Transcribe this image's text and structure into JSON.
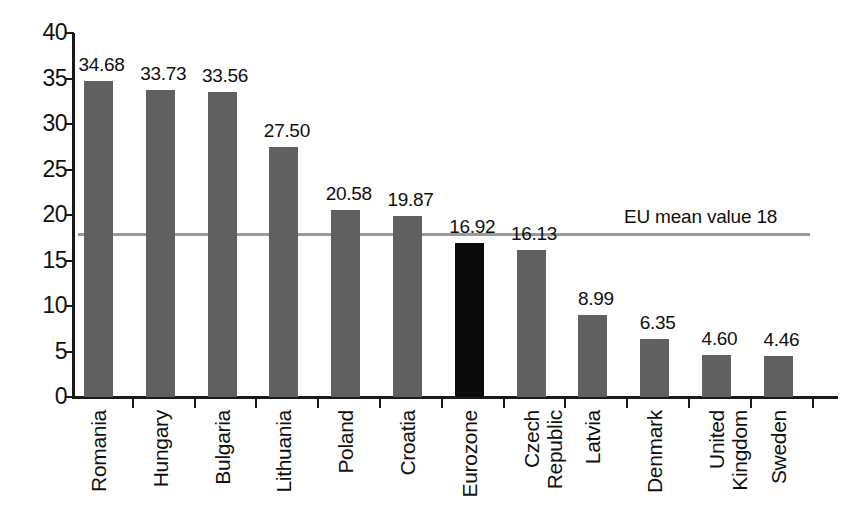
{
  "chart_data": {
    "type": "bar",
    "title": "",
    "subtitle": "",
    "xlabel": "",
    "ylabel": "",
    "ylim": [
      0,
      40
    ],
    "ytick_step": 5,
    "yticks": [
      "40",
      "35",
      "30",
      "25",
      "20",
      "15",
      "10",
      "5",
      "0"
    ],
    "grid": false,
    "legend": "none",
    "categories": [
      "Romania",
      "Hungary",
      "Bulgaria",
      "Lithuania",
      "Poland",
      "Croatia",
      "Eurozone",
      "Czech Republic",
      "Latvia",
      "Denmark",
      "United Kingdom",
      "Sweden"
    ],
    "category_lines": [
      [
        "Romania"
      ],
      [
        "Hungary"
      ],
      [
        "Bulgaria"
      ],
      [
        "Lithuania"
      ],
      [
        "Poland"
      ],
      [
        "Croatia"
      ],
      [
        "Eurozone"
      ],
      [
        "Czech",
        "Republic"
      ],
      [
        "Latvia"
      ],
      [
        "Denmark"
      ],
      [
        "United",
        "Kingdom"
      ],
      [
        "Sweden"
      ]
    ],
    "values": [
      34.68,
      33.73,
      33.56,
      27.5,
      20.58,
      19.87,
      16.92,
      16.13,
      8.99,
      6.35,
      4.6,
      4.46
    ],
    "value_labels": [
      "34.68",
      "33.73",
      "33.56",
      "27.50",
      "20.58",
      "19.87",
      "16.92",
      "16.13",
      "8.99",
      "6.35",
      "4.60",
      "4.46"
    ],
    "bar_colors": [
      "#606060",
      "#606060",
      "#606060",
      "#606060",
      "#606060",
      "#606060",
      "#0a0a0a",
      "#606060",
      "#606060",
      "#606060",
      "#606060",
      "#606060"
    ],
    "highlight_index": 6,
    "reference_line": {
      "label": "EU mean value 18",
      "value": 18,
      "color": "#9a9a9a"
    },
    "colors": {
      "bar_default": "#606060",
      "bar_highlight": "#0a0a0a",
      "axis": "#1a1a1a",
      "reference": "#9a9a9a",
      "background": "#ffffff",
      "text": "#101010"
    }
  }
}
